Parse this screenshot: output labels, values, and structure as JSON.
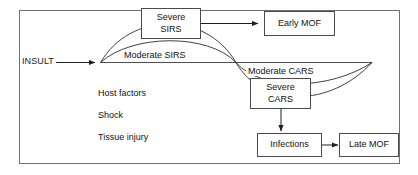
{
  "figure": {
    "frame": {
      "stroke": "#707070"
    },
    "colors": {
      "line": "#2b2b2b",
      "box_border": "#4a4a4a",
      "text": "#111111",
      "background": "#ffffff"
    },
    "entry": {
      "label": "INSULT"
    },
    "boxes": [
      {
        "id": "severe-sirs",
        "line1": "Severe",
        "line2": "SIRS"
      },
      {
        "id": "early-mof",
        "line1": "Early MOF",
        "line2": ""
      },
      {
        "id": "severe-cars",
        "line1": "Severe",
        "line2": "CARS"
      },
      {
        "id": "infections",
        "line1": "Infections",
        "line2": ""
      },
      {
        "id": "late-mof",
        "line1": "Late MOF",
        "line2": ""
      }
    ],
    "curve_labels": [
      {
        "id": "moderate-sirs",
        "text": "Moderate SIRS"
      },
      {
        "id": "moderate-cars",
        "text": "Moderate CARS"
      }
    ],
    "factors": [
      {
        "text": "Host factors"
      },
      {
        "text": "Shock"
      },
      {
        "text": "Tissue injury"
      }
    ]
  }
}
